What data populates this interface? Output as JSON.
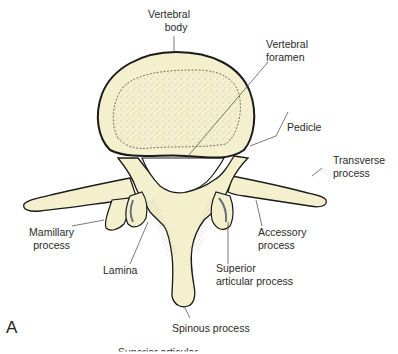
{
  "figure": {
    "panel_letter": "A",
    "colors": {
      "bone_fill": "#f4efcc",
      "outline": "#1a1a1a",
      "leader_line": "#555555",
      "label_text": "#2a2a2a"
    },
    "labels": {
      "vertebral_body": [
        "Vertebral",
        "body"
      ],
      "vertebral_foramen": [
        "Vertebral",
        "foramen"
      ],
      "pedicle": "Pedicle",
      "transverse_process": [
        "Transverse",
        "process"
      ],
      "mamillary_process": [
        "Mamillary",
        "process"
      ],
      "accessory_process": [
        "Accessory",
        "process"
      ],
      "lamina": "Lamina",
      "superior_articular_process": [
        "Superior",
        "articular process"
      ],
      "spinous_process": "Spinous process",
      "cut_off_bottom": "Superior articular"
    }
  }
}
